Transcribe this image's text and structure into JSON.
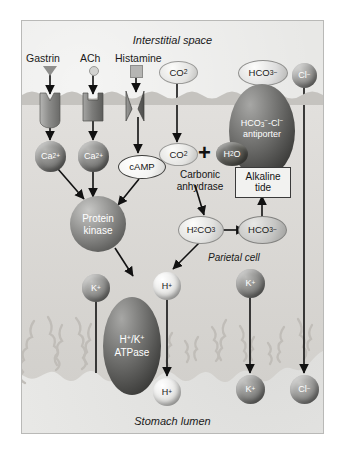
{
  "figure": {
    "top_label": "Interstitial space",
    "bottom_label": "Stomach lumen",
    "cell_label": "Parietal cell"
  },
  "ligands": [
    {
      "name": "Gastrin",
      "icon": "triangle-ligand-icon",
      "color": "#8f8f8d"
    },
    {
      "name": "ACh",
      "icon": "circle-ligand-icon",
      "color": "#c9c9c7"
    },
    {
      "name": "Histamine",
      "icon": "square-ligand-icon",
      "color": "#a9a9a7"
    }
  ],
  "receptors": [
    {
      "name": "gastrin-receptor",
      "color": "#8d8d8b"
    },
    {
      "name": "ach-receptor",
      "color": "#7e7e7c"
    },
    {
      "name": "histamine-receptor",
      "color": "#6f6f6d"
    }
  ],
  "messengers": [
    {
      "label": "Ca",
      "charge": "2+",
      "name": "calcium-ion-1",
      "color": "#6e6e6c"
    },
    {
      "label": "Ca",
      "charge": "2+",
      "name": "calcium-ion-2",
      "color": "#6e6e6c"
    },
    {
      "label": "cAMP",
      "name": "camp-molecule",
      "color": "#f4f4f2"
    }
  ],
  "protein_kinase": {
    "label_line1": "Protein",
    "label_line2": "kinase",
    "color": "#8a8a88"
  },
  "substrates": {
    "co2_outside": {
      "label": "CO",
      "sub": "2",
      "name": "co2-extracellular"
    },
    "co2_inside": {
      "label": "CO",
      "sub": "2",
      "name": "co2-intracellular"
    },
    "plus": "+",
    "h2o": {
      "label": "H",
      "sub": "2",
      "label2": "O",
      "name": "water-molecule",
      "color": "#555553"
    },
    "enzyme_line1": "Carbonic",
    "enzyme_line2": "anhydrase",
    "h2co3": {
      "label": "H",
      "sub": "2",
      "label2": "CO",
      "sub2": "3",
      "name": "carbonic-acid"
    },
    "hco3_inside": {
      "label": "HCO",
      "sub": "3",
      "sup": "−",
      "name": "bicarbonate-intracellular"
    }
  },
  "alkaline_tide": {
    "line1": "Alkaline",
    "line2": "tide"
  },
  "antiporter": {
    "line1": "HCO",
    "sub1": "3",
    "sup1": "−",
    "dash": "-Cl",
    "sup2": "−",
    "line2": "antiporter",
    "color": "#6a6a68"
  },
  "transported": [
    {
      "label": "HCO",
      "sub": "3",
      "sup": "−",
      "name": "bicarbonate-interstitial",
      "color": "#d6d6d4",
      "text": "#1a1a1a"
    },
    {
      "label": "Cl",
      "sup": "−",
      "name": "chloride-interstitial",
      "color": "#8c8c8a",
      "text": "#ffffff"
    }
  ],
  "pump": {
    "line1": "H",
    "sup1": "+",
    "slash": "/K",
    "sup2": "+",
    "line2": "ATPase",
    "name": "h-k-atpase-pump",
    "color": "#6b6b69"
  },
  "ions": [
    {
      "label": "K",
      "sup": "+",
      "name": "potassium-ion-cytosol",
      "color": "#7a7a78",
      "text": "#ffffff"
    },
    {
      "label": "H",
      "sup": "+",
      "name": "proton-cytosol",
      "color": "#dcdcda",
      "text": "#1a1a1a"
    },
    {
      "label": "H",
      "sup": "+",
      "name": "proton-lumen",
      "color": "#dcdcda",
      "text": "#1a1a1a"
    },
    {
      "label": "K",
      "sup": "+",
      "name": "potassium-ion-cell",
      "color": "#6f6f6d",
      "text": "#ffffff"
    },
    {
      "label": "K",
      "sup": "+",
      "name": "potassium-ion-lumen",
      "color": "#6f6f6d",
      "text": "#ffffff"
    },
    {
      "label": "Cl",
      "sup": "−",
      "name": "chloride-ion-lumen",
      "color": "#8c8c8a",
      "text": "#ffffff"
    }
  ],
  "colors": {
    "panel_bg": "#e8e8e6",
    "membrane": "#bdbdbb",
    "arrow": "#111111",
    "cytoplasm": "#dedcd8"
  }
}
